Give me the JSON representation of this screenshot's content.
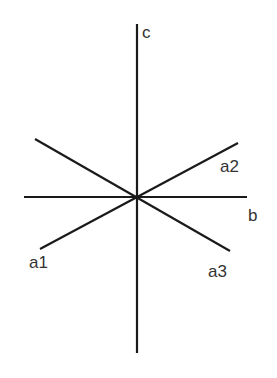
{
  "diagram": {
    "type": "crystallographic-axes",
    "colors": {
      "line": "#1a1a1a",
      "label": "#333333",
      "background": "#ffffff"
    },
    "center": {
      "x": 137,
      "y": 197
    },
    "axes": [
      {
        "id": "c",
        "label": "c",
        "from": [
          137,
          24
        ],
        "to": [
          137,
          353
        ],
        "label_pos": [
          142,
          38
        ]
      },
      {
        "id": "b",
        "label": "b",
        "from": [
          24,
          197
        ],
        "to": [
          247,
          197
        ],
        "label_pos": [
          248,
          221
        ]
      },
      {
        "id": "a2",
        "label": "a2",
        "from": [
          40,
          249
        ],
        "to": [
          238,
          143
        ],
        "label_pos": [
          220,
          172
        ]
      },
      {
        "id": "a3",
        "label": "a3",
        "from": [
          35,
          139
        ],
        "to": [
          230,
          251
        ],
        "label_pos": [
          208,
          277
        ]
      },
      {
        "id": "a1",
        "label": "a1",
        "label_pos": [
          30,
          268
        ]
      }
    ]
  }
}
